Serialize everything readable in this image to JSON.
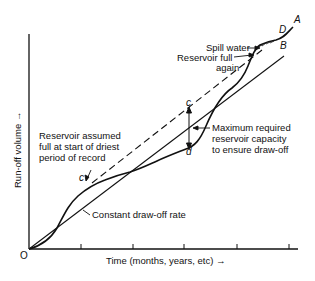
{
  "diagram": {
    "axes": {
      "x_label": "Time (months, years, etc) →",
      "y_label": "Run-off volume →",
      "origin_label": "O",
      "x_ticks": 5
    },
    "points": {
      "A": "A",
      "B": "B",
      "D": "D",
      "c_lower": "c",
      "c_upper": "c",
      "d": "d"
    },
    "annotations": {
      "spill_water": "Spill water",
      "reservoir_full_1": "Reservoir full",
      "reservoir_full_2": "again",
      "assumed_1": "Reservoir assumed",
      "assumed_2": "full at start of driest",
      "assumed_3": "period of record",
      "max_1": "Maximum required",
      "max_2": "reservoir capacity",
      "max_3": "to ensure draw-off",
      "drawoff": "Constant draw-off rate"
    },
    "colors": {
      "line": "#111111",
      "background": "#ffffff"
    }
  }
}
